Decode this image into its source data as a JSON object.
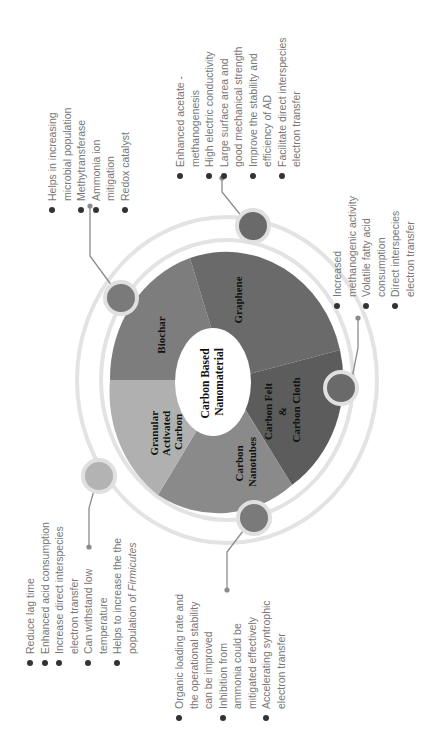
{
  "orientation": "rotated-90-ccw",
  "center": {
    "line1": "Carbon Based",
    "line2": "Nanomaterial"
  },
  "segments": [
    {
      "name": "Biochar",
      "lines": [
        "Biochar"
      ],
      "color": "#7d7d7d"
    },
    {
      "name": "Graphene",
      "lines": [
        "Graphene"
      ],
      "color": "#6a6a6a"
    },
    {
      "name": "Carbon Felt & Carbon Cloth",
      "lines": [
        "Carbon Felt",
        "&",
        "Carbon Cloth"
      ],
      "color": "#5c5c5c"
    },
    {
      "name": "Carbon Nanotubes",
      "lines": [
        "Carbon",
        "Nanotubes"
      ],
      "color": "#8a8a8a"
    },
    {
      "name": "Granular Activated Carbon",
      "lines": [
        "Granular",
        "Activated",
        "Carbon"
      ],
      "color": "#b0b0b0"
    }
  ],
  "colors": {
    "ring": "#e3e3e3",
    "connector": "#8c8c8c",
    "bullet": "#333333",
    "text": "#777777",
    "satellite_dark": "#6a6a6a",
    "satellite_mid": "#7a7a7a",
    "satellite_light": "#b3b3b3"
  },
  "lists": {
    "biochar": [
      [
        "Helps in increasing",
        "microbial population"
      ],
      [
        "Methytransferase"
      ],
      [
        "Ammonia ion",
        "mitigation"
      ],
      [
        "Redox catalyst"
      ]
    ],
    "graphene": [
      [
        "Enhanced acetate -",
        "methanogenesis"
      ],
      [
        "High electric conductivity"
      ],
      [
        "Large surface area and",
        "good mechanical strength"
      ],
      [
        "Improve the stability and",
        "efficiency of AD"
      ],
      [
        "Facilitate direct interspecies",
        "electron transfer"
      ]
    ],
    "carbon_felt_cloth": [
      [
        "Increased",
        "methanogenic activity"
      ],
      [
        "Volatile fatty acid",
        "consumption"
      ],
      [
        "Direct interspecies",
        "electron transfer"
      ]
    ],
    "carbon_nanotubes": [
      [
        "Organic loading rate and",
        "the operational stability",
        "can be improved"
      ],
      [
        "Inhibition from",
        "ammonia could be",
        "mitigated effectively"
      ],
      [
        "Accelerating syntrophic",
        "electron transfer"
      ]
    ],
    "granular_activated_carbon": [
      [
        "Reduce lag time"
      ],
      [
        "Enhanced acid consumption"
      ],
      [
        "Increase direct interspecies",
        "electron transfer"
      ],
      [
        "Can withstand low",
        "temperature"
      ],
      [
        "Helps to increase the the",
        "population of ",
        "Firmicutes"
      ]
    ]
  }
}
